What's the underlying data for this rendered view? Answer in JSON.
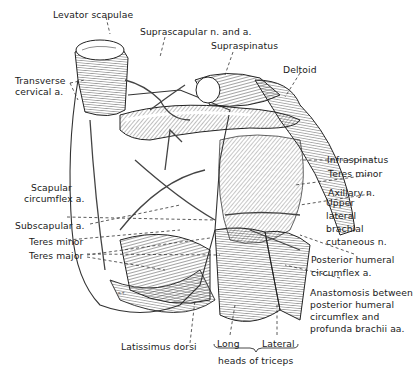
{
  "figure": {
    "signature": "R.T.",
    "labels": {
      "levator_scapulae": "Levator scapulae",
      "suprascapular": "Suprascapular n. and a.",
      "supraspinatus": "Supraspinatus",
      "deltoid": "Deltoid",
      "transverse_cervical_1": "Transverse",
      "transverse_cervical_2": "cervical a.",
      "infraspinatus": "Infraspinatus",
      "teres_minor_right": "Teres minor",
      "axillary_n": "Axillary n.",
      "upper_lateral_1": "Upper",
      "upper_lateral_2": "lateral",
      "upper_lateral_3": "brachial",
      "upper_lateral_4": "cutaneous n.",
      "scapular_circumflex_1": "Scapular",
      "scapular_circumflex_2": "circumflex a.",
      "subscapular": "Subscapular a.",
      "teres_minor_left": "Teres minor",
      "teres_major": "Teres major",
      "posterior_humeral_1": "Posterior humeral",
      "posterior_humeral_2": "circumflex a.",
      "anastomosis_1": "Anastomosis between",
      "anastomosis_2": "posterior humeral",
      "anastomosis_3": "circumflex and",
      "anastomosis_4": "profunda brachii aa.",
      "latissimus_dorsi": "Latissimus dorsi",
      "long": "Long",
      "lateral": "Lateral",
      "heads_of_triceps": "heads of triceps"
    }
  }
}
